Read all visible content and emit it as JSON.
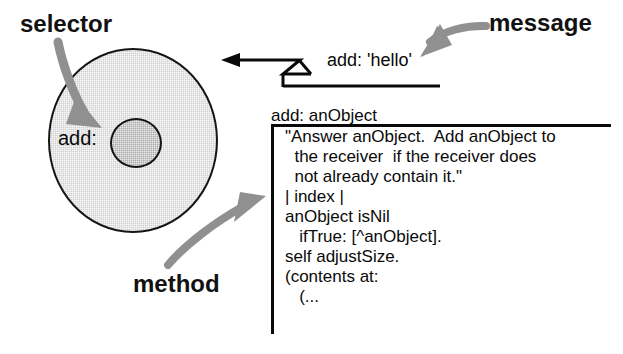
{
  "diagram": {
    "background_color": "#ffffff",
    "ink_color": "#0a0a0a",
    "object_fill_color": "#cfcfcf",
    "selector_fill_color": "#a8a8a8",
    "arrow_color": "#8c8c8c"
  },
  "labels": {
    "selector": "selector",
    "message": "message",
    "method": "method"
  },
  "object": {
    "selector_text": "add:"
  },
  "message": {
    "expression": "add: 'hello'"
  },
  "method": {
    "header": "add: anObject",
    "source_lines": [
      "\"Answer anObject.  Add anObject to",
      "  the receiver  if the receiver does",
      "  not already contain it.\"",
      "| index |",
      "anObject isNil",
      "   ifTrue: [^anObject].",
      "self adjustSize.",
      "(contents at:",
      "   (..."
    ]
  },
  "icons": {
    "selector_arrow": "curved-arrow-down-icon",
    "message_arrow": "curved-arrow-left-icon",
    "method_arrow": "curved-arrow-up-right-icon",
    "message_flow_arrow": "straight-arrow-left-icon"
  }
}
